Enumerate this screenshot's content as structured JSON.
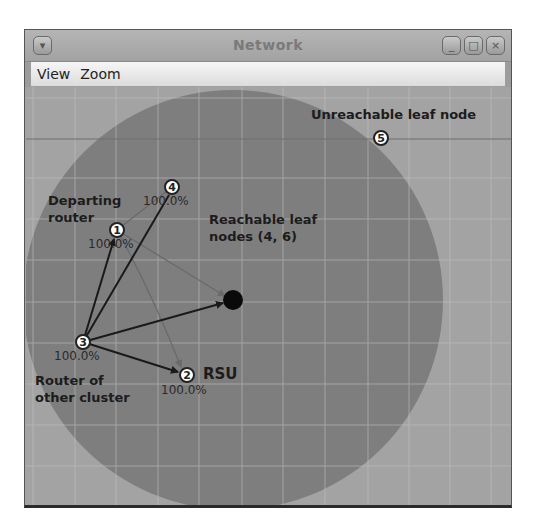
{
  "window": {
    "title": "Network",
    "buttons": {
      "menu": "▾",
      "minimize": "_",
      "maximize": "□",
      "close": "×"
    }
  },
  "menubar": {
    "items": [
      {
        "label": "View"
      },
      {
        "label": "Zoom"
      }
    ]
  },
  "graph": {
    "range_circle": {
      "cx": 232,
      "cy": 299,
      "r": 210,
      "color": "#7e7e7e"
    },
    "background_color": "#a3a3a3",
    "grid_spacing_px": 41.5,
    "nodes": [
      {
        "id": "1",
        "x": 116,
        "y": 229,
        "percent": "100.0%"
      },
      {
        "id": "2",
        "x": 186,
        "y": 374,
        "percent": "100.0%"
      },
      {
        "id": "3",
        "x": 82,
        "y": 341,
        "percent": "100.0%"
      },
      {
        "id": "4",
        "x": 171,
        "y": 186,
        "percent": "100.0%"
      },
      {
        "id": "5",
        "x": 380,
        "y": 137,
        "percent": ""
      }
    ],
    "center_node": {
      "x": 232,
      "y": 299,
      "label": "black-dot"
    },
    "edges": [
      {
        "from": "3",
        "to": "1",
        "style": "dark",
        "arrow": true
      },
      {
        "from": "3",
        "to": "4",
        "style": "dark",
        "arrow": false
      },
      {
        "from": "3",
        "to": "center",
        "style": "dark",
        "arrow": true
      },
      {
        "from": "3",
        "to": "2",
        "style": "dark",
        "arrow": true
      },
      {
        "from": "1",
        "to": "4",
        "style": "faint",
        "arrow": false
      },
      {
        "from": "1",
        "to": "center",
        "style": "faint",
        "arrow": true
      },
      {
        "from": "1",
        "to": "2",
        "style": "faint",
        "arrow": true
      }
    ],
    "annotations": {
      "departing_router": [
        "Departing",
        "router"
      ],
      "reachable_leaf": [
        "Reachable leaf",
        "nodes (4, 6)"
      ],
      "unreachable_leaf": "Unreachable leaf node",
      "router_other_cluster": [
        "Router of",
        "other cluster"
      ],
      "rsu": "RSU"
    }
  }
}
